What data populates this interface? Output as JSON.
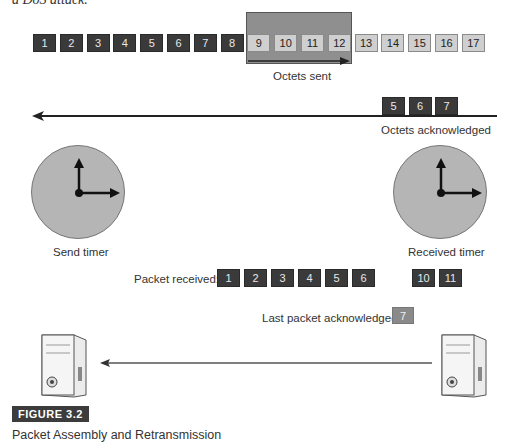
{
  "top_note": "a DoS attack.",
  "sent_row": {
    "boxes": [
      "1",
      "2",
      "3",
      "4",
      "5",
      "6",
      "7",
      "8",
      "9",
      "10",
      "11",
      "12",
      "13",
      "14",
      "15",
      "16",
      "17"
    ],
    "dark_count": 8,
    "window_label": "Octets sent"
  },
  "ack_row": {
    "boxes": [
      "5",
      "6",
      "7"
    ],
    "label": "Octets acknowledged"
  },
  "send_timer": {
    "label": "Send timer"
  },
  "received_timer": {
    "label": "Received timer"
  },
  "packet_received": {
    "label": "Packet received:",
    "boxes_a": [
      "1",
      "2",
      "3",
      "4",
      "5",
      "6"
    ],
    "boxes_b": [
      "10",
      "11"
    ]
  },
  "last_ack": {
    "label": "Last packet acknowledged:",
    "value": "7"
  },
  "figure": {
    "badge": "FIGURE 3.2",
    "caption": "Packet Assembly and Retransmission"
  },
  "colors": {
    "dark_box": "#3a3a3a",
    "light_box": "#cfcfcf",
    "window": "#8f8f8f",
    "clock": "#b5b5b5"
  }
}
